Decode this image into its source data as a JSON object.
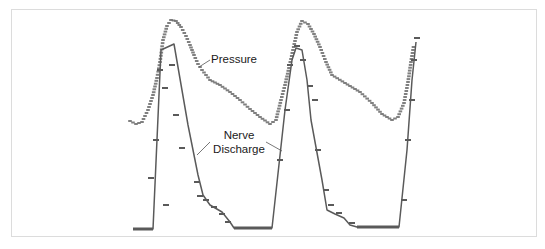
{
  "chart_data": {
    "type": "line",
    "title": "",
    "xlabel": "",
    "ylabel": "",
    "grid": false,
    "legend_position": "inline annotations",
    "annotations": [
      {
        "text": "Pressure",
        "target_series": "Pressure"
      },
      {
        "text": "Nerve Discharge",
        "target_series": "Nerve Discharge"
      }
    ],
    "series": [
      {
        "name": "Pressure",
        "style": "dotted markers",
        "color": "#6a6a6a",
        "points_px": [
          [
            130,
            121
          ],
          [
            136,
            124
          ],
          [
            142,
            122
          ],
          [
            148,
            110
          ],
          [
            153,
            95
          ],
          [
            157,
            78
          ],
          [
            160,
            62
          ],
          [
            163,
            40
          ],
          [
            167,
            26
          ],
          [
            171,
            20
          ],
          [
            176,
            21
          ],
          [
            181,
            27
          ],
          [
            186,
            36
          ],
          [
            190,
            45
          ],
          [
            194,
            55
          ],
          [
            198,
            64
          ],
          [
            202,
            70
          ],
          [
            210,
            80
          ],
          [
            220,
            85
          ],
          [
            230,
            92
          ],
          [
            240,
            100
          ],
          [
            250,
            109
          ],
          [
            260,
            117
          ],
          [
            270,
            124
          ],
          [
            276,
            120
          ],
          [
            281,
            100
          ],
          [
            285,
            85
          ],
          [
            289,
            68
          ],
          [
            293,
            50
          ],
          [
            297,
            32
          ],
          [
            302,
            21
          ],
          [
            308,
            24
          ],
          [
            314,
            34
          ],
          [
            320,
            47
          ],
          [
            326,
            62
          ],
          [
            332,
            75
          ],
          [
            345,
            83
          ],
          [
            360,
            92
          ],
          [
            372,
            103
          ],
          [
            382,
            114
          ],
          [
            392,
            120
          ],
          [
            398,
            117
          ],
          [
            404,
            103
          ],
          [
            408,
            82
          ],
          [
            411,
            62
          ],
          [
            414,
            44
          ]
        ]
      },
      {
        "name": "Nerve Discharge",
        "style": "solid line with tick markers",
        "color": "#5a5a5a",
        "points_px": [
          [
            133,
            229
          ],
          [
            153,
            229
          ],
          [
            161,
            50
          ],
          [
            174,
            44
          ],
          [
            188,
            125
          ],
          [
            198,
            175
          ],
          [
            203,
            195
          ],
          [
            210,
            205
          ],
          [
            222,
            212
          ],
          [
            230,
            222
          ],
          [
            234,
            228
          ],
          [
            272,
            228
          ],
          [
            285,
            110
          ],
          [
            292,
            60
          ],
          [
            296,
            48
          ],
          [
            302,
            50
          ],
          [
            307,
            80
          ],
          [
            311,
            120
          ],
          [
            322,
            180
          ],
          [
            327,
            210
          ],
          [
            335,
            214
          ],
          [
            344,
            218
          ],
          [
            350,
            225
          ],
          [
            357,
            227
          ],
          [
            399,
            227
          ],
          [
            407,
            150
          ],
          [
            412,
            80
          ],
          [
            416,
            42
          ]
        ]
      }
    ]
  },
  "labels": {
    "pressure": "Pressure",
    "nerve_line1": "Nerve",
    "nerve_line2": "Discharge"
  },
  "colors": {
    "frame": "#dcdcdc",
    "trace": "#5a5a5a",
    "text": "#1a1a1a"
  }
}
